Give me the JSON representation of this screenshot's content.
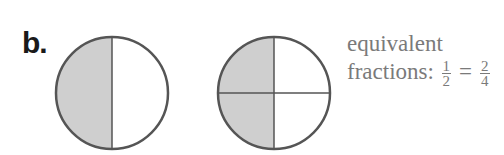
{
  "label": "b.",
  "colors": {
    "shade": "#cfcfcf",
    "outline": "#555555",
    "text": "#7a7a7a"
  },
  "figures": [
    {
      "name": "circle-halves",
      "parts": 2,
      "shaded": 1
    },
    {
      "name": "circle-quarters",
      "parts": 4,
      "shaded": 2
    }
  ],
  "caption": {
    "line1": "equivalent",
    "line2_prefix": "fractions:",
    "left_fraction": {
      "numerator": "1",
      "denominator": "2"
    },
    "equals": "=",
    "right_fraction": {
      "numerator": "2",
      "denominator": "4"
    }
  }
}
